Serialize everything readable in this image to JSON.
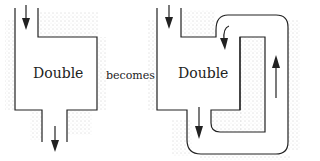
{
  "diagram": {
    "left_figure": {
      "label": "Double"
    },
    "connector": {
      "label": "becomes"
    },
    "right_figure": {
      "label": "Double"
    },
    "colors": {
      "ink": "#222222",
      "stipple": "#9a9a9a",
      "background": "#ffffff"
    }
  }
}
